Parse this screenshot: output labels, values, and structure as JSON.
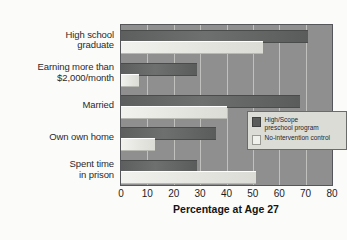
{
  "chart_data": {
    "type": "bar",
    "orientation": "horizontal",
    "title": "",
    "xlabel": "Percentage at Age 27",
    "ylabel": "",
    "xlim": [
      0,
      80
    ],
    "xticks": [
      0,
      10,
      20,
      30,
      40,
      50,
      60,
      70,
      80
    ],
    "grid": "vertical",
    "legend_position": "inside-right",
    "categories": [
      "High school\ngraduate",
      "Earning more than\n$2,000/month",
      "Married",
      "Own own home",
      "Spent time\nin prison"
    ],
    "series": [
      {
        "name": "High/Scope\npreschool program",
        "color": "#5d5e5e",
        "values": [
          71,
          29,
          68,
          36,
          29
        ]
      },
      {
        "name": "No-intervention control",
        "color": "#e8e8e3",
        "values": [
          54,
          7,
          40,
          13,
          51
        ]
      }
    ]
  },
  "legend": {
    "items": [
      {
        "label": "High/Scope\npreschool program",
        "swatch": "dark"
      },
      {
        "label": "No-intervention control",
        "swatch": "light"
      }
    ]
  },
  "colors": {
    "page_background": "#fbfbfa",
    "plot_background": "#8e8f8e",
    "gridline": "#c9cac6",
    "bar_dark": "#5d5e5e",
    "bar_light": "#e8e8e3",
    "axis_text": "#1d1d1d"
  }
}
